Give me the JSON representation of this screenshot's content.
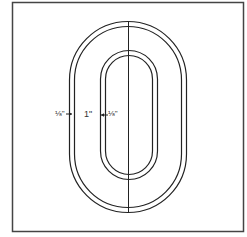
{
  "diagram": {
    "colors": {
      "background": "#ffffff",
      "stroke": "#222222",
      "frame": "#444444",
      "label": "#333333"
    },
    "frame": {
      "x": 12,
      "y": 2,
      "width": 231,
      "height": 229
    },
    "outer_oval": {
      "outline_1": {
        "x": 69,
        "y": 21,
        "width": 117,
        "height": 191
      },
      "outline_2": {
        "x": 74,
        "y": 26,
        "width": 107,
        "height": 181
      }
    },
    "inner_oval": {
      "outline_1": {
        "x": 100,
        "y": 50,
        "width": 57,
        "height": 129
      },
      "outline_2": {
        "x": 105,
        "y": 55,
        "width": 48,
        "height": 119
      }
    },
    "center_line": {
      "x": 128,
      "y1": 21,
      "y2": 212
    },
    "labels": {
      "outer_seam": "⅛\"",
      "width": "1\"",
      "inner_seam": "⅛\""
    }
  }
}
